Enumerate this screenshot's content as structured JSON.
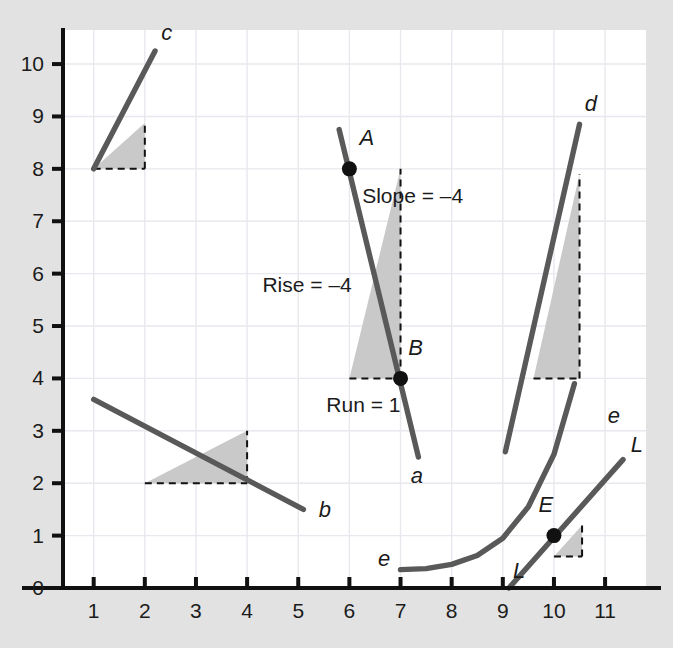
{
  "chart_data": {
    "type": "line",
    "title": "",
    "subtitle": "",
    "xlabel": "",
    "ylabel": "",
    "xlim": [
      0.4,
      11.8
    ],
    "ylim": [
      0,
      10.65
    ],
    "xticks": [
      1,
      2,
      3,
      4,
      5,
      6,
      7,
      8,
      9,
      10,
      11
    ],
    "yticks": [
      0,
      1,
      2,
      3,
      4,
      5,
      6,
      7,
      8,
      9,
      10
    ],
    "xtick_labels": [
      "1",
      "2",
      "3",
      "4",
      "5",
      "6",
      "7",
      "8",
      "9",
      "10",
      "11"
    ],
    "ytick_labels": [
      "0",
      "1",
      "2",
      "3",
      "4",
      "5",
      "6",
      "7",
      "8",
      "9",
      "10"
    ],
    "grid": true,
    "legend": false,
    "series": [
      {
        "name": "c",
        "label": "c",
        "type": "line",
        "points": [
          [
            1.0,
            8.0
          ],
          [
            2.2,
            10.25
          ]
        ],
        "slope": 1.875,
        "label_at": [
          2.32,
          10.45
        ]
      },
      {
        "name": "b",
        "label": "b",
        "type": "line",
        "points": [
          [
            1.0,
            3.6
          ],
          [
            5.1,
            1.5
          ]
        ],
        "slope": -0.512,
        "label_at": [
          5.4,
          1.35
        ]
      },
      {
        "name": "a",
        "label": "a",
        "type": "line",
        "points": [
          [
            5.8,
            8.75
          ],
          [
            7.35,
            2.5
          ]
        ],
        "slope": -4,
        "label_at": [
          7.2,
          2.0
        ]
      },
      {
        "name": "d",
        "label": "d",
        "type": "line",
        "points": [
          [
            9.05,
            2.6
          ],
          [
            10.5,
            8.85
          ]
        ],
        "slope": 4,
        "label_at": [
          10.6,
          9.1
        ]
      },
      {
        "name": "e",
        "label": "e",
        "type": "curve",
        "description": "exponential-like curve rising to the right",
        "points": [
          [
            7.0,
            0.35
          ],
          [
            7.5,
            0.37
          ],
          [
            8.0,
            0.45
          ],
          [
            8.5,
            0.62
          ],
          [
            9.0,
            0.95
          ],
          [
            9.5,
            1.55
          ],
          [
            10.0,
            2.55
          ],
          [
            10.4,
            3.9
          ]
        ],
        "label_left_at": [
          6.8,
          0.42
        ],
        "label_right_at": [
          11.05,
          3.15
        ]
      },
      {
        "name": "L",
        "label": "L",
        "type": "line",
        "description": "tangent line to curve e at point E",
        "points": [
          [
            9.12,
            0.0
          ],
          [
            11.35,
            2.45
          ]
        ],
        "label_bottom_at": [
          9.2,
          0.2
        ],
        "label_top_at": [
          11.5,
          2.6
        ]
      }
    ],
    "points": [
      {
        "name": "A",
        "label": "A",
        "x": 6.0,
        "y": 8.0,
        "label_at": [
          6.2,
          8.45
        ]
      },
      {
        "name": "B",
        "label": "B",
        "x": 7.0,
        "y": 4.0,
        "label_at": [
          7.15,
          4.45
        ]
      },
      {
        "name": "E",
        "label": "E",
        "x": 10.0,
        "y": 1.0,
        "label_at": [
          9.7,
          1.45
        ]
      }
    ],
    "rise_run_triangles": [
      {
        "for": "c",
        "x0": 1.0,
        "y0": 8.0,
        "x1": 2.0,
        "y1": 8.875,
        "shaded": true
      },
      {
        "for": "b",
        "x0": 2.0,
        "y0": 2.0,
        "x1": 4.0,
        "y1": 3.0,
        "shaded": true
      },
      {
        "for": "a",
        "x0": 6.0,
        "y0": 4.0,
        "x1": 7.0,
        "y1": 8.0,
        "shaded": true
      },
      {
        "for": "d",
        "x0": 9.6,
        "y0": 4.0,
        "x1": 10.5,
        "y1": 7.9,
        "shaded": true
      },
      {
        "for": "L",
        "x0": 10.0,
        "y0": 0.6,
        "x1": 10.55,
        "y1": 1.2,
        "shaded": true
      }
    ],
    "annotations": [
      {
        "name": "slope-annotation",
        "text": "Slope = –4",
        "x": 6.25,
        "y": 7.35
      },
      {
        "name": "rise-annotation",
        "text": "Rise = –4",
        "x": 4.3,
        "y": 5.65
      },
      {
        "name": "run-annotation",
        "text": "Run = 1",
        "x": 5.55,
        "y": 3.35
      }
    ],
    "colors": {
      "background": "#e2e2e2",
      "plot_background": "#ffffff",
      "line": "#595959",
      "axis": "#111111",
      "grid": "#e8e8ee",
      "shading": "#c9c9c9",
      "dashed": "#111111",
      "text": "#1b1b1b"
    }
  }
}
